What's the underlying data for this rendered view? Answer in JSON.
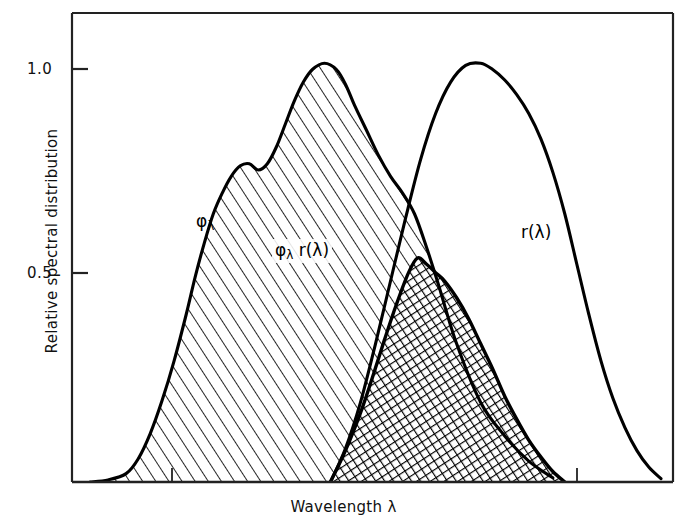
{
  "chart_data": {
    "type": "area",
    "title": "",
    "xlabel": "Wavelength   λ",
    "ylabel": "Relative spectral distribution",
    "ylim": [
      0,
      1.12
    ],
    "xlim": [
      0,
      1
    ],
    "grid": false,
    "legend_position": "inline-annotations",
    "y_ticks": [
      "1.0",
      "0.5"
    ],
    "y_tick_values": [
      1.0,
      0.5
    ],
    "x_ticks": [],
    "annotations": [
      {
        "name": "phi-lambda",
        "text": "φλ",
        "base": "φ",
        "sub": "λ",
        "x": 196,
        "y": 211
      },
      {
        "name": "phi-lambda-r-lambda",
        "text": "φλ r(λ)",
        "base": "φ",
        "sub": "λ",
        "tail": " r(λ)",
        "x": 272,
        "y": 239
      },
      {
        "name": "r-lambda",
        "text": "r(λ)",
        "x": 521,
        "y": 222
      }
    ],
    "series": [
      {
        "name": "φλ",
        "label": "φλ",
        "style": "diagonal-hatch",
        "color": "#000000",
        "x": [
          0.03,
          0.06,
          0.09,
          0.11,
          0.13,
          0.15,
          0.17,
          0.19,
          0.205,
          0.22,
          0.235,
          0.25,
          0.265,
          0.28,
          0.295,
          0.31,
          0.325,
          0.34,
          0.355,
          0.37,
          0.385,
          0.4,
          0.42,
          0.44,
          0.455,
          0.47,
          0.49,
          0.51,
          0.53,
          0.55,
          0.57,
          0.59,
          0.61,
          0.64,
          0.68,
          0.72,
          0.76,
          0.8
        ],
        "y": [
          0.0,
          0.005,
          0.02,
          0.055,
          0.115,
          0.195,
          0.29,
          0.4,
          0.49,
          0.57,
          0.64,
          0.69,
          0.73,
          0.755,
          0.76,
          0.745,
          0.76,
          0.8,
          0.855,
          0.91,
          0.955,
          0.985,
          1.0,
          0.985,
          0.95,
          0.9,
          0.84,
          0.78,
          0.73,
          0.69,
          0.64,
          0.56,
          0.47,
          0.33,
          0.19,
          0.11,
          0.05,
          0.01
        ]
      },
      {
        "name": "r(λ)",
        "label": "r(λ)",
        "style": "line",
        "color": "#000000",
        "x": [
          0.43,
          0.455,
          0.48,
          0.505,
          0.53,
          0.555,
          0.58,
          0.605,
          0.63,
          0.655,
          0.68,
          0.7,
          0.72,
          0.74,
          0.76,
          0.78,
          0.8,
          0.82,
          0.84,
          0.86,
          0.88,
          0.9,
          0.92,
          0.94,
          0.96,
          0.98
        ],
        "y": [
          0.0,
          0.08,
          0.19,
          0.33,
          0.48,
          0.63,
          0.77,
          0.88,
          0.955,
          0.995,
          1.0,
          0.985,
          0.96,
          0.925,
          0.88,
          0.82,
          0.74,
          0.64,
          0.52,
          0.4,
          0.29,
          0.2,
          0.13,
          0.075,
          0.035,
          0.008
        ]
      },
      {
        "name": "φλ r(λ)",
        "label": "φλ r(λ)",
        "style": "cross-hatch",
        "color": "#000000",
        "x": [
          0.43,
          0.455,
          0.48,
          0.5,
          0.52,
          0.54,
          0.56,
          0.575,
          0.59,
          0.605,
          0.62,
          0.64,
          0.66,
          0.68,
          0.7,
          0.72,
          0.74,
          0.76,
          0.78,
          0.8,
          0.82
        ],
        "y": [
          0.0,
          0.075,
          0.165,
          0.25,
          0.34,
          0.425,
          0.5,
          0.535,
          0.52,
          0.5,
          0.48,
          0.44,
          0.39,
          0.33,
          0.27,
          0.205,
          0.15,
          0.1,
          0.06,
          0.025,
          0.0
        ]
      }
    ]
  },
  "axes": {
    "y_tick_1": "1.0",
    "y_tick_2": "0.5",
    "y_axis_title": "Relative spectral distribution",
    "x_axis_title": "Wavelength   λ"
  },
  "annotations": {
    "phi_base": "φ",
    "phi_sub": "λ",
    "product_base": "φ",
    "product_sub": "λ",
    "product_tail": " r(λ)",
    "r_label": "r(λ)"
  },
  "colors": {
    "line": "#000000",
    "frame": "#222222",
    "background": "#ffffff",
    "text": "#111111"
  }
}
